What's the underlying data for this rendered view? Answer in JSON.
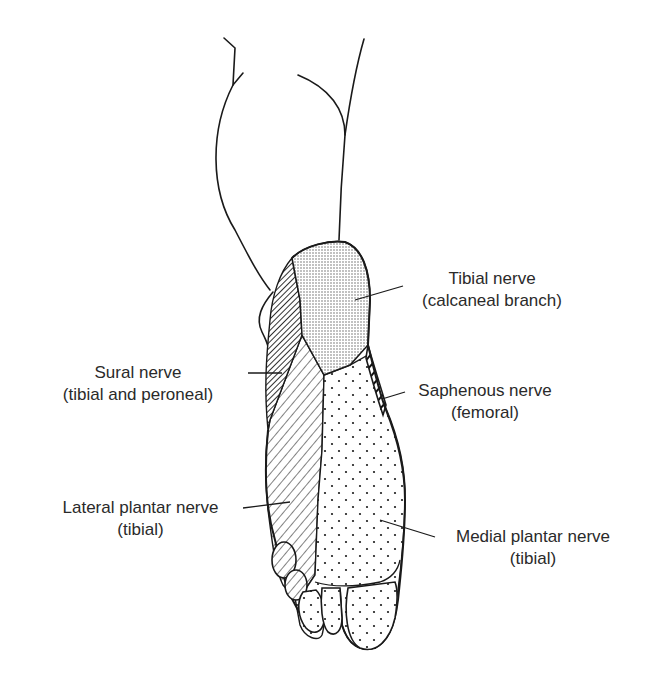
{
  "diagram": {
    "colors": {
      "outline": "#1a1a1a",
      "text": "#2a2a2a",
      "background": "#ffffff",
      "calcaneal_fill": "#e6e6e6"
    },
    "regions": [
      {
        "id": "tibial-calcaneal",
        "pattern": "fine-stipple"
      },
      {
        "id": "sural",
        "pattern": "dense-diagonal-hatch"
      },
      {
        "id": "saphenous",
        "pattern": "bold-diagonal-stripes"
      },
      {
        "id": "lateral-plantar",
        "pattern": "diagonal-hatch"
      },
      {
        "id": "medial-plantar",
        "pattern": "sparse-dots"
      }
    ],
    "labels": {
      "tibial": {
        "line1": "Tibial nerve",
        "line2": "(calcaneal branch)"
      },
      "sural": {
        "line1": "Sural nerve",
        "line2": "(tibial and peroneal)"
      },
      "saphenous": {
        "line1": "Saphenous nerve",
        "line2": "(femoral)"
      },
      "lateral_plantar": {
        "line1": "Lateral plantar nerve",
        "line2": "(tibial)"
      },
      "medial_plantar": {
        "line1": "Medial plantar nerve",
        "line2": "(tibial)"
      }
    }
  }
}
